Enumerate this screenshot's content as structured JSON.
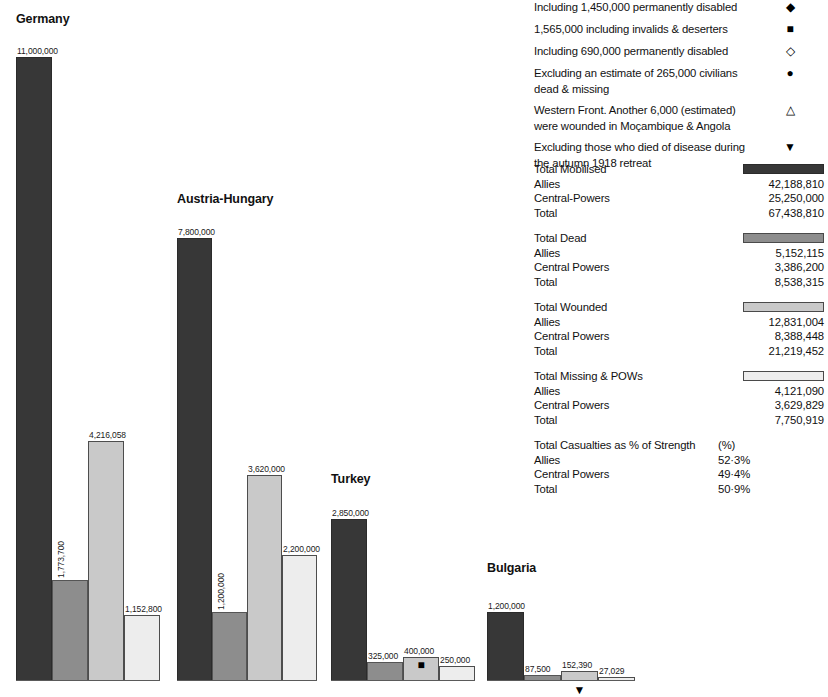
{
  "chart_data": {
    "type": "bar",
    "title": "",
    "xlabel": "",
    "ylabel": "",
    "ylim": [
      0,
      11000000
    ],
    "grid": false,
    "legend_position": "right",
    "series": [
      {
        "name": "Total Mobilised",
        "color": "#373737"
      },
      {
        "name": "Total Dead",
        "color": "#8d8d8d"
      },
      {
        "name": "Total Wounded",
        "color": "#c9c9c9"
      },
      {
        "name": "Total Missing & POWs",
        "color": "#ededed"
      }
    ],
    "categories": [
      "Germany",
      "Austria-Hungary",
      "Turkey",
      "Bulgaria"
    ],
    "groups": [
      {
        "name": "Germany",
        "bars": [
          {
            "series": "Total Mobilised",
            "value": 11000000,
            "label": "11,000,000",
            "label_orientation": "horizontal",
            "marker": ""
          },
          {
            "series": "Total Dead",
            "value": 1773700,
            "label": "1,773,700",
            "label_orientation": "vertical",
            "marker": ""
          },
          {
            "series": "Total Wounded",
            "value": 4216058,
            "label": "4,216,058",
            "label_orientation": "horizontal",
            "marker": ""
          },
          {
            "series": "Total Missing & POWs",
            "value": 1152800,
            "label": "1,152,800",
            "label_orientation": "horizontal",
            "marker": ""
          }
        ]
      },
      {
        "name": "Austria-Hungary",
        "bars": [
          {
            "series": "Total Mobilised",
            "value": 7800000,
            "label": "7,800,000",
            "label_orientation": "horizontal",
            "marker": ""
          },
          {
            "series": "Total Dead",
            "value": 1200000,
            "label": "1,200,000",
            "label_orientation": "vertical",
            "marker": ""
          },
          {
            "series": "Total Wounded",
            "value": 3620000,
            "label": "3,620,000",
            "label_orientation": "horizontal",
            "marker": ""
          },
          {
            "series": "Total Missing & POWs",
            "value": 2200000,
            "label": "2,200,000",
            "label_orientation": "horizontal",
            "marker": ""
          }
        ]
      },
      {
        "name": "Turkey",
        "bars": [
          {
            "series": "Total Mobilised",
            "value": 2850000,
            "label": "2,850,000",
            "label_orientation": "horizontal",
            "marker": ""
          },
          {
            "series": "Total Dead",
            "value": 325000,
            "label": "325,000",
            "label_orientation": "horizontal",
            "marker": ""
          },
          {
            "series": "Total Wounded",
            "value": 400000,
            "label": "400,000",
            "label_orientation": "horizontal",
            "marker": "■",
            "marker_position": "inside"
          },
          {
            "series": "Total Missing & POWs",
            "value": 250000,
            "label": "250,000",
            "label_orientation": "horizontal",
            "marker": ""
          }
        ]
      },
      {
        "name": "Bulgaria",
        "bars": [
          {
            "series": "Total Mobilised",
            "value": 1200000,
            "label": "1,200,000",
            "label_orientation": "horizontal",
            "marker": ""
          },
          {
            "series": "Total Dead",
            "value": 87500,
            "label": "87,500",
            "label_orientation": "horizontal",
            "marker": ""
          },
          {
            "series": "Total Wounded",
            "value": 152390,
            "label": "152,390",
            "label_orientation": "horizontal",
            "marker": "▼",
            "marker_position": "below"
          },
          {
            "series": "Total Missing & POWs",
            "value": 27029,
            "label": "27,029",
            "label_orientation": "horizontal",
            "marker": ""
          }
        ]
      }
    ]
  },
  "footnotes": [
    {
      "text": "Including 1,450,000 permanently disabled",
      "symbol": "◆"
    },
    {
      "text": "1,565,000 including invalids & deserters",
      "symbol": "■"
    },
    {
      "text": "Including 690,000 permanently disabled",
      "symbol": "◇"
    },
    {
      "text": "Excluding an estimate of 265,000 civilians dead & missing",
      "symbol": "●"
    },
    {
      "text": "Western Front. Another 6,000 (estimated) were wounded in Moçambique & Angola",
      "symbol": "△"
    },
    {
      "text": "Excluding those who died of disease during the autumn 1918 retreat",
      "symbol": "▼"
    }
  ],
  "summary": {
    "blocks": [
      {
        "heading": "Total Mobilised",
        "swatch": "s0",
        "rows": [
          {
            "label": "Allies",
            "value": "42,188,810"
          },
          {
            "label": "Central-Powers",
            "value": "25,250,000"
          },
          {
            "label": "Total",
            "value": "67,438,810"
          }
        ]
      },
      {
        "heading": "Total Dead",
        "swatch": "s1",
        "rows": [
          {
            "label": "Allies",
            "value": "5,152,115"
          },
          {
            "label": "Central Powers",
            "value": "3,386,200"
          },
          {
            "label": "Total",
            "value": "8,538,315"
          }
        ]
      },
      {
        "heading": "Total Wounded",
        "swatch": "s2",
        "rows": [
          {
            "label": "Allies",
            "value": "12,831,004"
          },
          {
            "label": "Central Powers",
            "value": "8,388,448"
          },
          {
            "label": "Total",
            "value": "21,219,452"
          }
        ]
      },
      {
        "heading": "Total Missing & POWs",
        "swatch": "s3",
        "rows": [
          {
            "label": "Allies",
            "value": "4,121,090"
          },
          {
            "label": "Central Powers",
            "value": "3,629,829"
          },
          {
            "label": "Total",
            "value": "7,750,919"
          }
        ]
      },
      {
        "heading": "Total Casualties as % of Strength",
        "swatch": "",
        "unit": "(%)",
        "rows": [
          {
            "label": "Allies",
            "value": "52·3%"
          },
          {
            "label": "Central Powers",
            "value": "49·4%"
          },
          {
            "label": "Total",
            "value": "50·9%"
          }
        ]
      }
    ]
  }
}
